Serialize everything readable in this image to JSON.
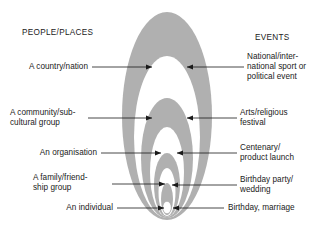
{
  "diagram": {
    "title_left": "PEOPLE/PLACES",
    "title_right": "EVENTS",
    "colors": {
      "ellipse_fill": "#b0b0b0",
      "ellipse_inner_white": "#ffffff",
      "line": "#1a1a1a",
      "text": "#1a1a1a",
      "background": "#ffffff"
    },
    "levels": [
      {
        "id": "country",
        "left_label": "A country/nation",
        "right_label": "National/inter-\nnational sport or\npolitical event",
        "right_label_lines": [
          "National/inter-",
          "national sport or",
          "political event"
        ]
      },
      {
        "id": "community",
        "left_label": "A community/sub-\ncultural group",
        "left_label_lines": [
          "A community/sub-",
          "cultural group"
        ],
        "right_label": "Arts/religious\nfestival",
        "right_label_lines": [
          "Arts/religious",
          "festival"
        ]
      },
      {
        "id": "organisation",
        "left_label": "An organisation",
        "right_label": "Centenary/\nproduct launch",
        "right_label_lines": [
          "Centenary/",
          "product launch"
        ]
      },
      {
        "id": "family",
        "left_label": "A family/friend-\nship group",
        "left_label_lines": [
          "A family/friend-",
          "ship group"
        ],
        "right_label": "Birthday party/\nwedding",
        "right_label_lines": [
          "Birthday party/",
          "wedding"
        ]
      },
      {
        "id": "individual",
        "left_label": "An individual",
        "right_label": "Birthday, marriage",
        "right_label_lines": [
          "Birthday, marriage"
        ]
      }
    ],
    "label_text": {
      "country_left": "A country/nation",
      "country_right_1": "National/inter-",
      "country_right_2": "national sport or",
      "country_right_3": "political event",
      "community_left_1": "A community/sub-",
      "community_left_2": "cultural group",
      "community_right_1": "Arts/religious",
      "community_right_2": "festival",
      "organisation_left": "An organisation",
      "organisation_right_1": "Centenary/",
      "organisation_right_2": "product launch",
      "family_left_1": "A family/friend-",
      "family_left_2": "ship group",
      "family_right_1": "Birthday party/",
      "family_right_2": "wedding",
      "individual_left": "An individual",
      "individual_right": "Birthday, marriage"
    }
  }
}
